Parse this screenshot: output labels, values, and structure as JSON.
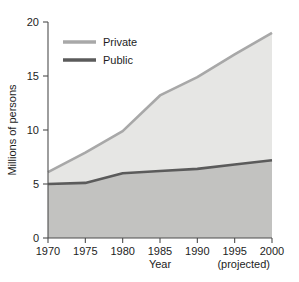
{
  "chart_data": {
    "type": "area",
    "title": "",
    "subtitle": "",
    "xlabel": "Year",
    "ylabel": "Millions of persons",
    "x": [
      1970,
      1975,
      1980,
      1985,
      1990,
      1995,
      2000
    ],
    "xlim": [
      1970,
      2000
    ],
    "ylim": [
      0,
      20
    ],
    "xticks": [
      "1970",
      "1975",
      "1980",
      "1985",
      "1990",
      "1995",
      "2000"
    ],
    "yticks": [
      "0",
      "5",
      "10",
      "15",
      "20"
    ],
    "grid": false,
    "stacked": true,
    "legend_position": "top-left",
    "annotation": "(projected)",
    "series": [
      {
        "name": "Private",
        "color": "#a8a8a8",
        "fill": "#e6e6e4",
        "values": [
          6.1,
          7.9,
          9.9,
          13.2,
          14.9,
          17.0,
          19.0
        ]
      },
      {
        "name": "Public",
        "color": "#5b5b5b",
        "fill": "#c2c2c0",
        "values": [
          5.0,
          5.1,
          6.0,
          6.2,
          6.4,
          6.8,
          7.2
        ]
      }
    ]
  },
  "legend": {
    "items": [
      {
        "label": "Private",
        "color": "#a8a8a8"
      },
      {
        "label": "Public",
        "color": "#5b5b5b"
      }
    ]
  },
  "axes": {
    "y_title": "Millions of persons",
    "x_title": "Year",
    "x_note": "(projected)"
  },
  "colors": {
    "private_line": "#a8a8a8",
    "private_fill": "#e6e6e4",
    "public_line": "#5b5b5b",
    "public_fill": "#c2c2c0",
    "axis": "#4d4d4d",
    "text": "#1d1d1d",
    "background": "#ffffff"
  }
}
